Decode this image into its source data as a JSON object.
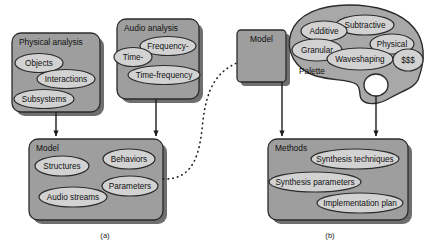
{
  "figure": {
    "captions": [
      {
        "id": "caption-a",
        "text": "(a)",
        "x": 105,
        "y": 238
      },
      {
        "id": "caption-b",
        "text": "(b)",
        "x": 330,
        "y": 238
      }
    ]
  },
  "colors": {
    "container_fill": "#9e9e9e",
    "ellipse_fill": "#d2d2d2",
    "palette_fill": "#a8a8a8",
    "stroke": "#2b2b2b",
    "shadow": "#6f6f6f",
    "background": "#ffffff",
    "text": "#111111"
  },
  "panel_a": {
    "physical_analysis": {
      "title": "Physical analysis",
      "x": 12,
      "y": 33,
      "w": 88,
      "h": 79,
      "nodes": [
        {
          "label": "Objects",
          "cx": 39,
          "cy": 63,
          "rx": 24,
          "ry": 9.5
        },
        {
          "label": "Interactions",
          "cx": 66,
          "cy": 79,
          "rx": 29,
          "ry": 9.5
        },
        {
          "label": "Subsystems",
          "cx": 44,
          "cy": 99,
          "rx": 30,
          "ry": 9.5
        }
      ]
    },
    "audio_analysis": {
      "title": "Audio analysis",
      "x": 117,
      "y": 19,
      "w": 82,
      "h": 80,
      "nodes": [
        {
          "label": "Time-",
          "cx": 133,
          "cy": 57,
          "rx": 19,
          "ry": 9.5
        },
        {
          "label": "Frequency-",
          "cx": 168,
          "cy": 46,
          "rx": 28,
          "ry": 9.5
        },
        {
          "label": "Time-frequency",
          "cx": 164,
          "cy": 75,
          "rx": 36,
          "ry": 9.5
        }
      ]
    },
    "model": {
      "title": "Model",
      "x": 29,
      "y": 139,
      "w": 134,
      "h": 81,
      "nodes": [
        {
          "label": "Structures",
          "cx": 62,
          "cy": 166,
          "rx": 27,
          "ry": 10
        },
        {
          "label": "Behaviors",
          "cx": 129,
          "cy": 159,
          "rx": 26,
          "ry": 10
        },
        {
          "label": "Parameters",
          "cx": 130,
          "cy": 186,
          "rx": 28,
          "ry": 10
        },
        {
          "label": "Audio streams",
          "cx": 73,
          "cy": 197,
          "rx": 34,
          "ry": 10
        }
      ]
    },
    "arrows": [
      {
        "name": "arrow-physical-to-model",
        "x1": 56,
        "y1": 112,
        "x2": 56,
        "y2": 139
      },
      {
        "name": "arrow-audio-to-model",
        "x1": 156,
        "y1": 99,
        "x2": 156,
        "y2": 139
      }
    ],
    "link": {
      "name": "dotted-link-model-to-model",
      "style": "dotted-curve"
    }
  },
  "panel_b": {
    "model": {
      "title": "Model",
      "x": 237,
      "y": 30,
      "w": 49,
      "h": 52
    },
    "palette": {
      "title": "Palette",
      "nodes": [
        {
          "label": "Additive",
          "cx": 324,
          "cy": 31,
          "rx": 23,
          "ry": 10
        },
        {
          "label": "Subtractive",
          "cx": 365,
          "cy": 25,
          "rx": 29,
          "ry": 10
        },
        {
          "label": "Granular",
          "cx": 317,
          "cy": 50,
          "rx": 25,
          "ry": 11
        },
        {
          "label": "Waveshaping",
          "cx": 360,
          "cy": 59,
          "rx": 33,
          "ry": 11
        },
        {
          "label": "Physical",
          "cx": 392,
          "cy": 44,
          "rx": 22,
          "ry": 10
        },
        {
          "label": "$$$",
          "cx": 408,
          "cy": 60,
          "rx": 15,
          "ry": 11
        }
      ],
      "label_pos": {
        "x": 312,
        "y": 72
      },
      "thumb_hole": {
        "cx": 376,
        "cy": 85,
        "rx": 12,
        "ry": 11
      }
    },
    "methods": {
      "title": "Methods",
      "x": 268,
      "y": 139,
      "w": 140,
      "h": 81,
      "nodes": [
        {
          "label": "Synthesis techniques",
          "cx": 355,
          "cy": 159,
          "rx": 44,
          "ry": 10
        },
        {
          "label": "Synthesis parameters",
          "cx": 315,
          "cy": 182,
          "rx": 46,
          "ry": 10
        },
        {
          "label": "Implementation plan",
          "cx": 360,
          "cy": 203,
          "rx": 43,
          "ry": 10
        }
      ]
    },
    "arrows": [
      {
        "name": "arrow-model-to-methods",
        "x1": 282,
        "y1": 82,
        "x2": 282,
        "y2": 139
      },
      {
        "name": "arrow-palette-to-methods",
        "x1": 376,
        "y1": 96,
        "x2": 376,
        "y2": 139
      }
    ]
  }
}
